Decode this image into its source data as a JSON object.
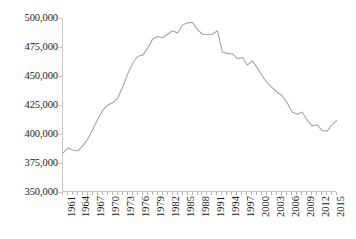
{
  "chart_data": {
    "type": "line",
    "title": "",
    "subtitle": "",
    "xlabel": "",
    "ylabel": "",
    "ylim": [
      350000,
      500000
    ],
    "ytick_values": [
      350000,
      375000,
      400000,
      425000,
      450000,
      475000,
      500000
    ],
    "ytick_labels": [
      "350,000",
      "375,000",
      "400,000",
      "425,000",
      "450,000",
      "475,000",
      "500,000"
    ],
    "xlim": [
      1961,
      2016
    ],
    "xtick_labels": [
      "1961",
      "1964",
      "1967",
      "1970",
      "1973",
      "1976",
      "1979",
      "1982",
      "1985",
      "1988",
      "1991",
      "1994",
      "1997",
      "2000",
      "2003",
      "2006",
      "2009",
      "2012",
      "2015"
    ],
    "xtick_values": [
      1961,
      1964,
      1967,
      1970,
      1973,
      1976,
      1979,
      1982,
      1985,
      1988,
      1991,
      1994,
      1997,
      2000,
      2003,
      2006,
      2009,
      2012,
      2015
    ],
    "grid": false,
    "legend": "none",
    "line_color": "#a6a6a6",
    "line_width": 1.1,
    "axis_color": "#c9c9c9",
    "background": "#ffffff",
    "x": [
      1961,
      1962,
      1963,
      1964,
      1965,
      1966,
      1967,
      1968,
      1969,
      1970,
      1971,
      1972,
      1973,
      1974,
      1975,
      1976,
      1977,
      1978,
      1979,
      1980,
      1981,
      1982,
      1983,
      1984,
      1985,
      1986,
      1987,
      1988,
      1989,
      1990,
      1991,
      1992,
      1993,
      1994,
      1995,
      1996,
      1997,
      1998,
      1999,
      2000,
      2001,
      2002,
      2003,
      2004,
      2005,
      2006,
      2007,
      2008,
      2009,
      2010,
      2011,
      2012,
      2013,
      2014,
      2015,
      2016
    ],
    "series": [
      {
        "name": "Value",
        "values": [
          383500,
          388000,
          386000,
          385500,
          390000,
          396000,
          404000,
          413000,
          420500,
          425000,
          427000,
          431000,
          441000,
          452000,
          461000,
          467000,
          468000,
          474000,
          482000,
          484000,
          483000,
          486000,
          489000,
          487000,
          494000,
          496000,
          496000,
          490000,
          486000,
          485500,
          486000,
          489000,
          470500,
          469500,
          469000,
          465000,
          466000,
          459500,
          463000,
          457000,
          450000,
          444000,
          440000,
          436000,
          433000,
          427000,
          419000,
          417000,
          419000,
          412000,
          407000,
          408000,
          403000,
          402500,
          408000,
          412000
        ]
      }
    ]
  }
}
